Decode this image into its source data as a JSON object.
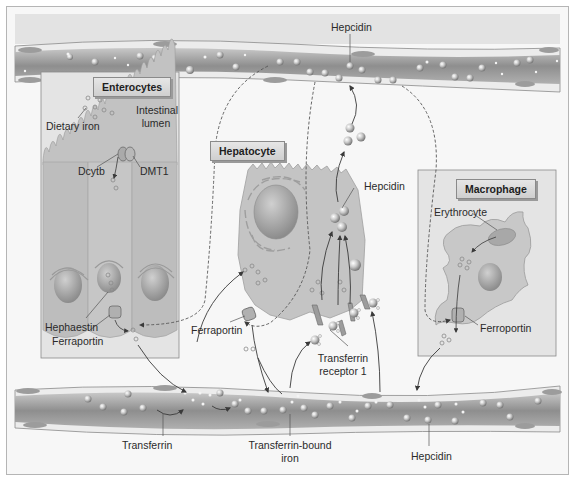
{
  "diagram": {
    "compartments": {
      "enterocytes": "Enterocytes",
      "hepatocyte": "Hepatocyte",
      "macrophage": "Macrophage"
    },
    "labels": {
      "hepcidin_top": "Hepcidin",
      "dietary_iron": "Dietary iron",
      "intestinal_lumen_1": "Intestinal",
      "intestinal_lumen_2": "lumen",
      "dcytb": "Dcytb",
      "dmt1": "DMT1",
      "hephaestin": "Hephaestin",
      "ferraportin_enterocyte": "Ferraportin",
      "hepcidin_hepatocyte": "Hepcidin",
      "ferraportin_hepatocyte": "Ferraportin",
      "transferrin_receptor_1": "Transferrin",
      "transferrin_receptor_2": "receptor 1",
      "erythrocyte": "Erythrocyte",
      "ferroportin_macrophage": "Ferroportin",
      "transferrin": "Transferrin",
      "transferrin_bound_iron_1": "Transferrin-bound",
      "transferrin_bound_iron_2": "iron",
      "hepcidin_bottom": "Hepcidin"
    },
    "colors": {
      "vessel_fill": "#9a9a9a",
      "vessel_wall": "#e9e9e9",
      "cell_fill": "#c4c4c4",
      "box_fill": "#e4e4e4",
      "nucleus": "#a8a8a8",
      "background": "#f7f7f7"
    }
  }
}
